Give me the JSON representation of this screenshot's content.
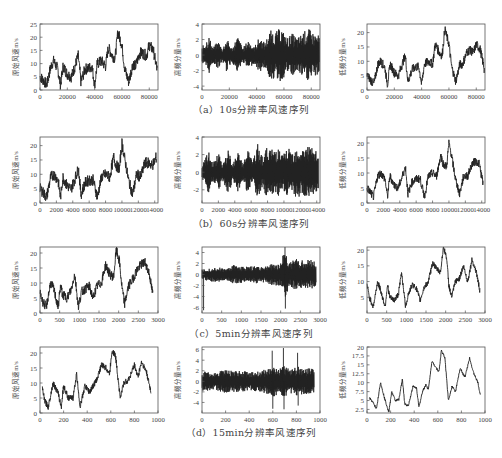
{
  "figure": {
    "captions": [
      "（a）10s分辨率风速序列",
      "（b）60s分辨率风速序列",
      "（c）5min分辨率风速序列",
      "（d）15min分辨率风速序列"
    ],
    "column_ylabels": [
      "原始风速m/s",
      "高频分量m/s",
      "低频分量m/s"
    ],
    "line_color": "#222222",
    "axis_color": "#555555"
  },
  "chart_data": [
    {
      "row": "a",
      "col": "original",
      "type": "line",
      "title": "",
      "ylabel": "原始风速m/s",
      "xlabel": "",
      "xlim": [
        0,
        86400
      ],
      "ylim": [
        0,
        25
      ],
      "xticks": [
        0,
        20000,
        40000,
        60000,
        80000
      ],
      "yticks": [
        0,
        5,
        10,
        15,
        20,
        25
      ],
      "x": [
        0,
        2000,
        5000,
        8000,
        10000,
        13000,
        15000,
        17000,
        20000,
        23000,
        25000,
        28000,
        30000,
        33000,
        35000,
        38000,
        40000,
        42000,
        45000,
        48000,
        50000,
        53000,
        55000,
        57000,
        60000,
        62000,
        65000,
        68000,
        70000,
        73000,
        75000,
        78000,
        80000,
        83000,
        86000
      ],
      "values": [
        5,
        4,
        2,
        9,
        11,
        8,
        2,
        9,
        6,
        5,
        8,
        13,
        3,
        8,
        8,
        9,
        2,
        10,
        11,
        9,
        16,
        13,
        12,
        22,
        17,
        8,
        3,
        10,
        9,
        14,
        14,
        13,
        17,
        15,
        7
      ],
      "noise_amplitude": 2.2
    },
    {
      "row": "a",
      "col": "high_freq",
      "type": "line",
      "title": "",
      "ylabel": "高频分量m/s",
      "xlabel": "",
      "xlim": [
        0,
        86400
      ],
      "ylim": [
        -4.5,
        4
      ],
      "xticks": [
        0,
        20000,
        40000,
        60000,
        80000
      ],
      "yticks": [
        -4,
        -2,
        0,
        2,
        4
      ],
      "envelope_x": [
        0,
        5000,
        8000,
        12000,
        15000,
        18000,
        22000,
        26000,
        30000,
        34000,
        38000,
        42000,
        46000,
        50000,
        54000,
        58000,
        62000,
        66000,
        70000,
        74000,
        78000,
        82000,
        86000
      ],
      "envelope": [
        1.0,
        2.5,
        1.0,
        1.8,
        0.8,
        2.2,
        0.8,
        2.5,
        0.9,
        2.0,
        1.0,
        2.3,
        1.6,
        3.2,
        3.0,
        3.6,
        2.2,
        2.8,
        2.2,
        3.0,
        3.4,
        2.8,
        2.5
      ]
    },
    {
      "row": "a",
      "col": "low_freq",
      "type": "line",
      "title": "",
      "ylabel": "低频分量m/s",
      "xlabel": "",
      "xlim": [
        0,
        86400
      ],
      "ylim": [
        0,
        23
      ],
      "xticks": [
        0,
        20000,
        40000,
        60000,
        80000
      ],
      "yticks": [
        0,
        5,
        10,
        15,
        20
      ],
      "x": [
        0,
        2000,
        5000,
        8000,
        10000,
        13000,
        15000,
        17000,
        20000,
        23000,
        25000,
        28000,
        30000,
        33000,
        35000,
        38000,
        40000,
        42000,
        45000,
        48000,
        50000,
        53000,
        55000,
        57000,
        60000,
        62000,
        65000,
        68000,
        70000,
        73000,
        75000,
        78000,
        80000,
        83000,
        86000
      ],
      "values": [
        5,
        4,
        2,
        9,
        10,
        8,
        2,
        9,
        6,
        5,
        8,
        12,
        3,
        7,
        8,
        8,
        2,
        9,
        10,
        9,
        16,
        13,
        12,
        21,
        16,
        8,
        3,
        9,
        9,
        13,
        14,
        13,
        16,
        14,
        7
      ],
      "noise_amplitude": 1.6
    },
    {
      "row": "b",
      "col": "original",
      "type": "line",
      "title": "",
      "ylabel": "原始风速m/s",
      "xlabel": "",
      "xlim": [
        0,
        14400
      ],
      "ylim": [
        0,
        23
      ],
      "xticks": [
        0,
        2000,
        4000,
        6000,
        8000,
        10000,
        12000,
        14000
      ],
      "yticks": [
        0,
        5,
        10,
        15,
        20
      ],
      "x": [
        0,
        300,
        800,
        1300,
        1700,
        2200,
        2500,
        2800,
        3300,
        3800,
        4200,
        4700,
        5000,
        5500,
        6000,
        6500,
        7000,
        7500,
        8000,
        8500,
        9000,
        9300,
        9700,
        10000,
        10300,
        10800,
        11300,
        11800,
        12300,
        12800,
        13300,
        13700,
        14200
      ],
      "values": [
        5,
        4,
        2,
        9,
        10,
        8,
        2,
        9,
        6,
        5,
        8,
        12,
        3,
        7,
        8,
        8,
        2,
        9,
        10,
        9,
        16,
        13,
        12,
        21,
        16,
        8,
        3,
        10,
        9,
        14,
        14,
        13,
        16
      ],
      "noise_amplitude": 2.0
    },
    {
      "row": "b",
      "col": "high_freq",
      "type": "line",
      "title": "",
      "ylabel": "高频分量m/s",
      "xlabel": "",
      "xlim": [
        0,
        14400
      ],
      "ylim": [
        -3.5,
        4
      ],
      "xticks": [
        0,
        2000,
        4000,
        6000,
        8000,
        10000,
        12000,
        14000
      ],
      "yticks": [
        -2,
        0,
        2,
        4
      ],
      "envelope_x": [
        0,
        800,
        1300,
        2000,
        2500,
        3200,
        3800,
        4400,
        5000,
        5600,
        6200,
        6800,
        7400,
        8000,
        8600,
        9200,
        9800,
        10400,
        11000,
        11600,
        12200,
        12800,
        13400,
        14200
      ],
      "envelope": [
        0.8,
        2.4,
        1.0,
        2.2,
        0.9,
        2.5,
        1.0,
        2.3,
        1.0,
        2.6,
        1.2,
        3.2,
        1.8,
        3.0,
        2.6,
        3.0,
        2.0,
        2.8,
        2.4,
        3.0,
        2.6,
        3.2,
        2.8,
        2.2
      ]
    },
    {
      "row": "b",
      "col": "low_freq",
      "type": "line",
      "title": "",
      "ylabel": "低频分量m/s",
      "xlabel": "",
      "xlim": [
        0,
        14400
      ],
      "ylim": [
        0,
        22
      ],
      "xticks": [
        0,
        2000,
        4000,
        6000,
        8000,
        10000,
        12000,
        14000
      ],
      "yticks": [
        0,
        5,
        10,
        15,
        20
      ],
      "x": [
        0,
        300,
        800,
        1300,
        1700,
        2200,
        2500,
        2800,
        3300,
        3800,
        4200,
        4700,
        5000,
        5500,
        6000,
        6500,
        7000,
        7500,
        8000,
        8500,
        9000,
        9300,
        9700,
        10000,
        10300,
        10800,
        11300,
        11800,
        12300,
        12800,
        13300,
        13700,
        14200
      ],
      "values": [
        5,
        4,
        2,
        9,
        10,
        8,
        2,
        9,
        6,
        5,
        8,
        12,
        3,
        7,
        8,
        8,
        2,
        9,
        10,
        9,
        16,
        13,
        12,
        20,
        16,
        8,
        3,
        9,
        9,
        13,
        14,
        13,
        6
      ],
      "noise_amplitude": 1.4
    },
    {
      "row": "c",
      "col": "original",
      "type": "line",
      "title": "",
      "ylabel": "原始风速m/s",
      "xlabel": "",
      "xlim": [
        0,
        3000
      ],
      "ylim": [
        0,
        22
      ],
      "xticks": [
        0,
        500,
        1000,
        1500,
        2000,
        2500,
        3000
      ],
      "yticks": [
        0,
        5,
        10,
        15,
        20
      ],
      "x": [
        0,
        60,
        160,
        270,
        350,
        460,
        520,
        580,
        690,
        800,
        880,
        980,
        1050,
        1150,
        1250,
        1350,
        1450,
        1560,
        1670,
        1770,
        1870,
        1940,
        2020,
        2080,
        2150,
        2250,
        2350,
        2450,
        2560,
        2670,
        2780,
        2870
      ],
      "values": [
        7,
        4,
        2,
        10,
        8,
        2,
        9,
        6,
        5,
        8,
        13,
        2,
        7,
        8,
        9,
        5,
        9,
        10,
        16,
        13,
        12,
        21,
        17,
        9,
        3,
        9,
        11,
        14,
        16,
        17,
        13,
        6
      ],
      "noise_amplitude": 1.6
    },
    {
      "row": "c",
      "col": "high_freq",
      "type": "line",
      "title": "",
      "ylabel": "高频分量m/s",
      "xlabel": "",
      "xlim": [
        0,
        3000
      ],
      "ylim": [
        -7,
        5
      ],
      "xticks": [
        0,
        500,
        1000,
        1500,
        2000,
        2500,
        3000
      ],
      "yticks": [
        -6,
        -4,
        -2,
        0,
        2,
        4
      ],
      "envelope_x": [
        0,
        200,
        400,
        600,
        800,
        1000,
        1200,
        1400,
        1600,
        1800,
        2000,
        2100,
        2200,
        2400,
        2600,
        2800,
        2900
      ],
      "envelope": [
        1.0,
        1.2,
        1.4,
        1.0,
        1.8,
        1.5,
        1.4,
        1.6,
        1.5,
        2.0,
        2.0,
        4.8,
        2.5,
        2.8,
        2.6,
        2.8,
        2.2
      ],
      "spikes": [
        {
          "x": 40,
          "y": -6.5
        },
        {
          "x": 2110,
          "y": 5
        },
        {
          "x": 2120,
          "y": -6.2
        }
      ]
    },
    {
      "row": "c",
      "col": "low_freq",
      "type": "line",
      "title": "",
      "ylabel": "低频分量m/s",
      "xlabel": "",
      "xlim": [
        0,
        3000
      ],
      "ylim": [
        0,
        21
      ],
      "xticks": [
        0,
        500,
        1000,
        1500,
        2000,
        2500,
        3000
      ],
      "yticks": [
        5,
        10,
        15,
        20
      ],
      "x": [
        0,
        60,
        160,
        270,
        350,
        460,
        520,
        580,
        690,
        800,
        880,
        980,
        1050,
        1150,
        1250,
        1350,
        1450,
        1560,
        1670,
        1770,
        1870,
        1940,
        2020,
        2080,
        2150,
        2250,
        2350,
        2450,
        2560,
        2670,
        2780,
        2870
      ],
      "values": [
        9,
        5,
        2,
        10,
        7,
        2,
        9,
        5,
        4,
        6,
        13,
        2,
        6,
        9,
        8,
        4,
        8,
        10,
        16,
        14,
        13,
        21,
        18,
        9,
        5,
        10,
        11,
        15,
        10,
        17,
        13,
        7
      ],
      "noise_amplitude": 0.9
    },
    {
      "row": "d",
      "col": "original",
      "type": "line",
      "title": "",
      "ylabel": "原始风速m/s",
      "xlabel": "",
      "xlim": [
        0,
        1000
      ],
      "ylim": [
        0,
        22
      ],
      "xticks": [
        0,
        200,
        400,
        600,
        800,
        1000
      ],
      "yticks": [
        0,
        5,
        10,
        15,
        20
      ],
      "x": [
        20,
        40,
        70,
        110,
        150,
        180,
        200,
        240,
        280,
        310,
        340,
        380,
        420,
        450,
        480,
        520,
        560,
        590,
        610,
        640,
        680,
        710,
        750,
        800,
        830,
        860,
        900,
        940
      ],
      "values": [
        8,
        4,
        2,
        10,
        7,
        2,
        9,
        5,
        5,
        13,
        2,
        9,
        7,
        9,
        11,
        16,
        15,
        13,
        21,
        19,
        5,
        10,
        11,
        16,
        12,
        17,
        14,
        7
      ],
      "noise_amplitude": 1.0
    },
    {
      "row": "d",
      "col": "high_freq",
      "type": "line",
      "title": "",
      "ylabel": "高频分量m/s",
      "xlabel": "",
      "xlim": [
        0,
        1000
      ],
      "ylim": [
        -6,
        6.5
      ],
      "xticks": [
        0,
        200,
        400,
        600,
        800,
        1000
      ],
      "yticks": [
        -4,
        -2,
        0,
        2,
        4,
        6
      ],
      "envelope_x": [
        0,
        100,
        200,
        300,
        400,
        500,
        550,
        600,
        650,
        700,
        750,
        800,
        850,
        900,
        950
      ],
      "envelope": [
        2.0,
        1.6,
        2.2,
        2.0,
        1.8,
        2.0,
        2.4,
        3.0,
        2.4,
        3.0,
        2.4,
        3.0,
        2.4,
        2.6,
        2.2
      ],
      "spikes": [
        {
          "x": 595,
          "y": 5.8
        },
        {
          "x": 600,
          "y": -5.2
        },
        {
          "x": 690,
          "y": 6.3
        },
        {
          "x": 695,
          "y": -5.3
        },
        {
          "x": 810,
          "y": 5.4
        },
        {
          "x": 815,
          "y": -4.6
        }
      ]
    },
    {
      "row": "d",
      "col": "low_freq",
      "type": "line",
      "title": "",
      "ylabel": "低频分量m/s",
      "xlabel": "",
      "xlim": [
        0,
        1000
      ],
      "ylim": [
        1.5,
        20
      ],
      "xticks": [
        0,
        200,
        400,
        600,
        800,
        1000
      ],
      "yticks": [
        2.5,
        5.0,
        7.5,
        10.0,
        12.5,
        15.0,
        17.5,
        20.0
      ],
      "x": [
        20,
        50,
        80,
        115,
        150,
        185,
        210,
        240,
        270,
        300,
        320,
        350,
        390,
        420,
        440,
        470,
        500,
        520,
        550,
        580,
        610,
        630,
        660,
        690,
        720,
        750,
        790,
        830,
        870,
        900,
        940,
        960
      ],
      "values": [
        5.7,
        4.5,
        2.7,
        10.0,
        5.5,
        1.8,
        7.5,
        5.0,
        5.3,
        11.0,
        4.0,
        3.5,
        9.0,
        8.5,
        3.0,
        7.5,
        9.5,
        8.0,
        16.0,
        14.5,
        13.0,
        19.0,
        17.0,
        5.0,
        9.0,
        7.5,
        14.0,
        11.5,
        17.0,
        13.0,
        10.0,
        6.5
      ],
      "noise_amplitude": 0.3
    }
  ]
}
